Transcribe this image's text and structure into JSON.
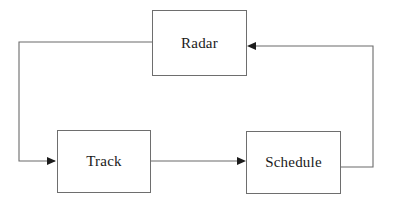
{
  "diagram": {
    "type": "block-diagram",
    "canvas": {
      "width": 393,
      "height": 206,
      "background": "#ffffff"
    },
    "style": {
      "box_border_color": "#6e6e6e",
      "line_color": "#6b6b6b",
      "arrow_color": "#1c1c1c",
      "text_color": "#1a1a1a"
    },
    "nodes": [
      {
        "id": "radar",
        "label": "Radar",
        "x": 152,
        "y": 10,
        "width": 95,
        "height": 66
      },
      {
        "id": "track",
        "label": "Track",
        "x": 57,
        "y": 130,
        "width": 94,
        "height": 63
      },
      {
        "id": "schedule",
        "label": "Schedule",
        "x": 246,
        "y": 131,
        "width": 95,
        "height": 63
      }
    ],
    "edges": [
      {
        "id": "radar-to-track",
        "from": "radar",
        "to": "track",
        "from_side": "left",
        "to_side": "left",
        "arrow": true,
        "points": "152,42 19,42 19,161 55,161"
      },
      {
        "id": "track-to-schedule",
        "from": "track",
        "to": "schedule",
        "from_side": "right",
        "to_side": "left",
        "arrow": true,
        "points": "151,161 244,161"
      },
      {
        "id": "schedule-to-radar",
        "from": "schedule",
        "to": "radar",
        "from_side": "right",
        "to_side": "right",
        "arrow": true,
        "points": "341,167 373,167 373,46 249,46"
      }
    ]
  }
}
